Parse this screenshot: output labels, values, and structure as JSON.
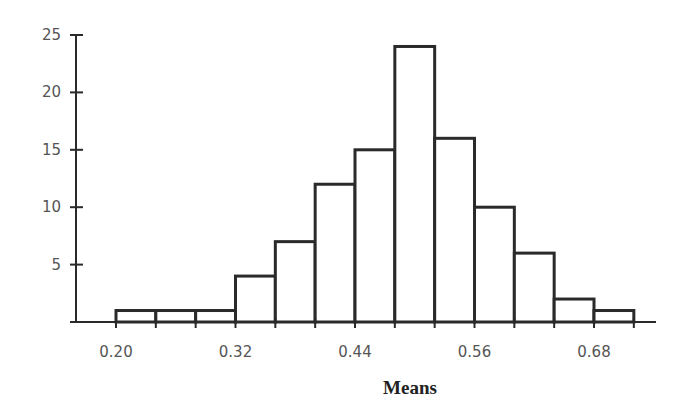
{
  "chart_data": {
    "type": "bar",
    "title": "",
    "xlabel": "Means",
    "ylabel": "",
    "bin_edges": [
      0.2,
      0.24,
      0.28,
      0.32,
      0.36,
      0.4,
      0.44,
      0.48,
      0.52,
      0.56,
      0.6,
      0.64,
      0.68,
      0.72
    ],
    "categories": [
      "0.20-0.24",
      "0.24-0.28",
      "0.28-0.32",
      "0.32-0.36",
      "0.36-0.40",
      "0.40-0.44",
      "0.44-0.48",
      "0.48-0.52",
      "0.52-0.56",
      "0.56-0.60",
      "0.60-0.64",
      "0.64-0.68",
      "0.68-0.72"
    ],
    "values": [
      1,
      1,
      1,
      4,
      7,
      12,
      15,
      24,
      16,
      10,
      6,
      2,
      1
    ],
    "x_tick_labels": [
      "0.20",
      "0.32",
      "0.44",
      "0.56",
      "0.68"
    ],
    "x_tick_values": [
      0.2,
      0.32,
      0.44,
      0.56,
      0.68
    ],
    "y_tick_labels": [
      "5",
      "10",
      "15",
      "20",
      "25"
    ],
    "y_tick_values": [
      5,
      10,
      15,
      20,
      25
    ],
    "ylim": [
      0,
      25
    ],
    "grid": false,
    "legend": null
  }
}
